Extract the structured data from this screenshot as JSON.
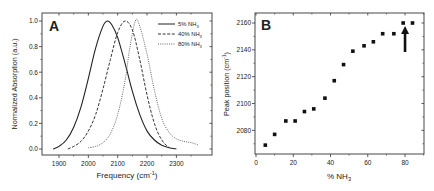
{
  "chart_data": [
    {
      "panel": "A",
      "type": "line",
      "title": "",
      "panel_label": "A",
      "xlabel": "Frequency (cm⁻¹)",
      "ylabel": "Normalized Absorption (a.u.)",
      "xlim": [
        1860,
        2380
      ],
      "ylim": [
        -0.03,
        1.05
      ],
      "xticks": [
        1900,
        2000,
        2100,
        2200,
        2300
      ],
      "yticks": [
        0.0,
        0.2,
        0.4,
        0.6,
        0.8,
        1.0
      ],
      "ytick_labels": [
        "0.0",
        "0.2",
        "0.4",
        "0.6",
        "0.8",
        "1.0"
      ],
      "grid": false,
      "legend_position": "upper right",
      "series": [
        {
          "name": "5% NH₃",
          "style": "solid",
          "peak": 2065,
          "x": [
            1880,
            1900,
            1925,
            1950,
            1975,
            2000,
            2025,
            2050,
            2065,
            2080,
            2100,
            2125,
            2150,
            2175,
            2200,
            2225,
            2250,
            2275,
            2300
          ],
          "y": [
            0.0,
            0.02,
            0.07,
            0.17,
            0.33,
            0.55,
            0.79,
            0.96,
            1.0,
            0.97,
            0.87,
            0.67,
            0.45,
            0.27,
            0.14,
            0.07,
            0.03,
            0.01,
            0.0
          ]
        },
        {
          "name": "40% NH₃",
          "style": "dashed",
          "peak": 2125,
          "x": [
            1930,
            1950,
            1975,
            2000,
            2025,
            2050,
            2075,
            2100,
            2125,
            2150,
            2175,
            2200,
            2225,
            2250,
            2275
          ],
          "y": [
            0.0,
            0.02,
            0.06,
            0.14,
            0.27,
            0.47,
            0.7,
            0.91,
            1.0,
            0.93,
            0.7,
            0.42,
            0.2,
            0.07,
            0.01
          ]
        },
        {
          "name": "80% NH₃",
          "style": "dotted",
          "peak": 2160,
          "x": [
            2000,
            2025,
            2050,
            2075,
            2100,
            2125,
            2140,
            2160,
            2175,
            2200,
            2225,
            2250,
            2275,
            2300,
            2325,
            2350,
            2375
          ],
          "y": [
            0.01,
            0.02,
            0.05,
            0.12,
            0.27,
            0.53,
            0.77,
            1.0,
            0.96,
            0.74,
            0.46,
            0.24,
            0.13,
            0.08,
            0.06,
            0.05,
            0.03
          ]
        }
      ]
    },
    {
      "panel": "B",
      "type": "scatter",
      "title": "",
      "panel_label": "B",
      "xlabel": "% NH₃",
      "ylabel": "Peak position (cm⁻¹)",
      "xlim": [
        0,
        90
      ],
      "ylim": [
        2062,
        2167
      ],
      "xticks": [
        0,
        20,
        40,
        60,
        80
      ],
      "yticks": [
        2080,
        2100,
        2120,
        2140,
        2160
      ],
      "grid": false,
      "annotation": {
        "type": "arrow",
        "target_x": 80,
        "target_y": 2160,
        "direction": "up"
      },
      "x": [
        5,
        10,
        16,
        21,
        26,
        31,
        37,
        42,
        47,
        52,
        58,
        63,
        68,
        74,
        79,
        84
      ],
      "y": [
        2069,
        2077,
        2087,
        2087,
        2094,
        2096,
        2104,
        2117,
        2129,
        2139,
        2143,
        2146,
        2152,
        2152,
        2160,
        2160
      ]
    }
  ]
}
